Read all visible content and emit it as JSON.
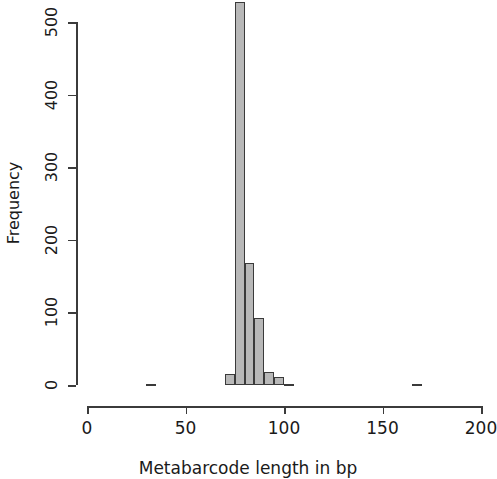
{
  "chart_data": {
    "type": "bar",
    "title": "",
    "subtitle": "",
    "xlabel": "Metabarcode length in bp",
    "ylabel": "Frequency",
    "xlim": [
      0,
      200
    ],
    "ylim": [
      0,
      530
    ],
    "grid": false,
    "legend": null,
    "bin_width": 5,
    "x_ticks": [
      0,
      50,
      100,
      150,
      200
    ],
    "x_tick_labels": [
      "0",
      "50",
      "100",
      "150",
      "200"
    ],
    "y_ticks": [
      0,
      100,
      200,
      300,
      400,
      500
    ],
    "y_tick_labels": [
      "0",
      "100",
      "200",
      "300",
      "400",
      "500"
    ],
    "bins": [
      {
        "x0": 30,
        "x1": 35,
        "value": 2
      },
      {
        "x0": 35,
        "x1": 40,
        "value": 0
      },
      {
        "x0": 40,
        "x1": 45,
        "value": 0
      },
      {
        "x0": 45,
        "x1": 50,
        "value": 0
      },
      {
        "x0": 50,
        "x1": 55,
        "value": 0
      },
      {
        "x0": 55,
        "x1": 60,
        "value": 0
      },
      {
        "x0": 60,
        "x1": 65,
        "value": 0
      },
      {
        "x0": 65,
        "x1": 70,
        "value": 0
      },
      {
        "x0": 70,
        "x1": 75,
        "value": 15
      },
      {
        "x0": 75,
        "x1": 80,
        "value": 527
      },
      {
        "x0": 80,
        "x1": 85,
        "value": 168
      },
      {
        "x0": 85,
        "x1": 90,
        "value": 92
      },
      {
        "x0": 90,
        "x1": 95,
        "value": 18
      },
      {
        "x0": 95,
        "x1": 100,
        "value": 11
      },
      {
        "x0": 100,
        "x1": 105,
        "value": 2
      },
      {
        "x0": 165,
        "x1": 170,
        "value": 2
      }
    ]
  },
  "axes": {
    "y_title": "Frequency",
    "x_title": "Metabarcode length in bp"
  }
}
